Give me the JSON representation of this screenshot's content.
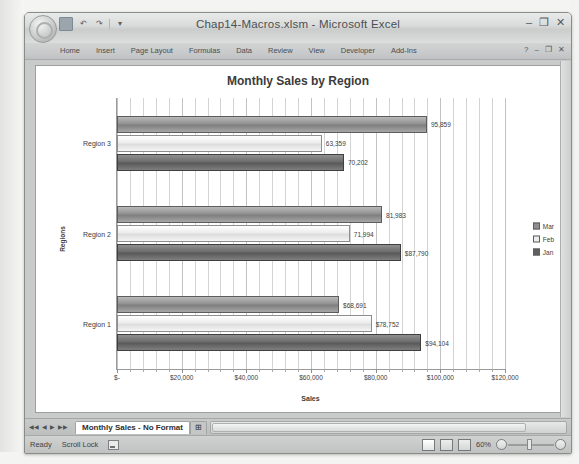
{
  "window": {
    "title": "Chap14-Macros.xlsm - Microsoft Excel",
    "minimize_label": "–",
    "restore_label": "❐",
    "close_label": "✕",
    "office_button_label": "Office",
    "qat": {
      "save_label": "Save",
      "undo_label": "Undo",
      "redo_label": "Redo",
      "customize_label": "Customize Quick Access Toolbar"
    }
  },
  "ribbon": {
    "tabs": [
      {
        "label": "Home"
      },
      {
        "label": "Insert"
      },
      {
        "label": "Page Layout"
      },
      {
        "label": "Formulas"
      },
      {
        "label": "Data"
      },
      {
        "label": "Review"
      },
      {
        "label": "View"
      },
      {
        "label": "Developer"
      },
      {
        "label": "Add-Ins"
      }
    ],
    "help_label": "?",
    "minimize_ribbon_label": "–",
    "restore_ribbon_label": "❐",
    "close_ribbon_label": "✕"
  },
  "chart_data": {
    "type": "bar",
    "orientation": "horizontal",
    "title": "Monthly Sales by Region",
    "xlabel": "Sales",
    "ylabel": "Regions",
    "categories": [
      "Region 1",
      "Region 2",
      "Region 3"
    ],
    "series": [
      {
        "name": "Jan",
        "values": [
          94104,
          87790,
          70202
        ],
        "labels": [
          "$94,104",
          "$87,790",
          "70,202"
        ]
      },
      {
        "name": "Feb",
        "values": [
          78752,
          71994,
          63359
        ],
        "labels": [
          "$78,752",
          "71,994",
          "63,359"
        ]
      },
      {
        "name": "Mar",
        "values": [
          68691,
          81983,
          95859
        ],
        "labels": [
          "$68,691",
          "81,983",
          "95,859"
        ]
      }
    ],
    "legend": [
      "Mar",
      "Feb",
      "Jan"
    ],
    "legend_position": "right",
    "xlim": [
      0,
      120000
    ],
    "xticks": [
      0,
      20000,
      40000,
      60000,
      80000,
      100000,
      120000
    ],
    "xticklabels": [
      "$-",
      "$20,000",
      "$40,000",
      "$60,000",
      "$80,000",
      "$100,000",
      "$120,000"
    ],
    "grid": true,
    "minor_gridlines": true
  },
  "sheet_tabs": {
    "nav_first": "◀◀",
    "nav_prev": "◀",
    "nav_next": "▶",
    "nav_last": "▶▶",
    "tabs": [
      {
        "label": "Monthly Sales - No Format"
      }
    ],
    "insert_tab_label": "⊞"
  },
  "status_bar": {
    "mode": "Ready",
    "scroll_lock": "Scroll Lock",
    "macro_record_label": "Record Macro",
    "view_normal_label": "Normal",
    "view_layout_label": "Page Layout",
    "view_break_label": "Page Break Preview",
    "zoom_level": "60%",
    "zoom_out_label": "−",
    "zoom_in_label": "+"
  }
}
